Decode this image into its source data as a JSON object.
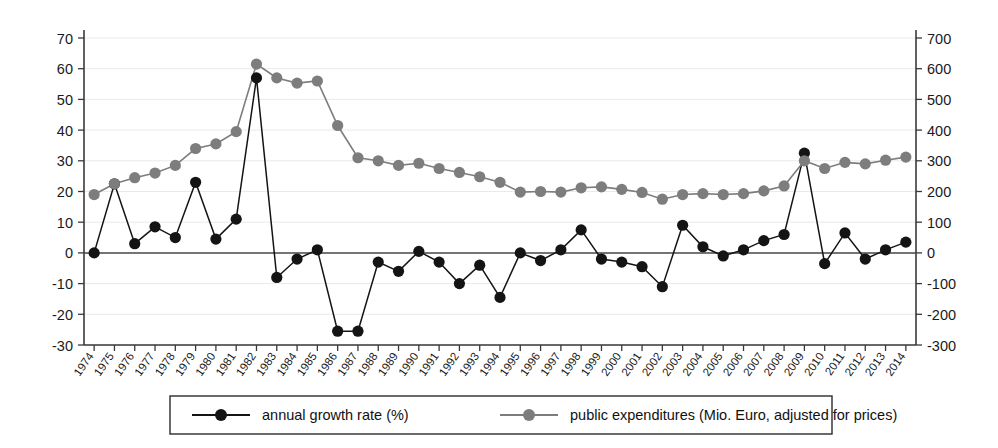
{
  "chart_data": {
    "type": "line",
    "title": "",
    "xlabel": "",
    "ylabel_left": "",
    "ylabel_right": "",
    "grid": true,
    "legend_position": "bottom",
    "categories": [
      "1974",
      "1975",
      "1976",
      "1977",
      "1978",
      "1979",
      "1980",
      "1981",
      "1982",
      "1983",
      "1984",
      "1985",
      "1986",
      "1987",
      "1988",
      "1989",
      "1990",
      "1991",
      "1992",
      "1993",
      "1994",
      "1995",
      "1996",
      "1997",
      "1998",
      "1999",
      "2000",
      "2001",
      "2002",
      "2003",
      "2004",
      "2005",
      "2006",
      "2007",
      "2008",
      "2009",
      "2010",
      "2011",
      "2012",
      "2013",
      "2014"
    ],
    "left_axis": {
      "label": "",
      "min": -30,
      "max": 70,
      "step": 10,
      "ticks": [
        "70",
        "60",
        "50",
        "40",
        "30",
        "20",
        "10",
        "0",
        "-10",
        "-20",
        "-30"
      ],
      "tick_values": [
        70,
        60,
        50,
        40,
        30,
        20,
        10,
        0,
        -10,
        -20,
        -30
      ]
    },
    "right_axis": {
      "label": "",
      "min": -300,
      "max": 700,
      "step": 100,
      "ticks": [
        "700",
        "600",
        "500",
        "400",
        "300",
        "200",
        "100",
        "0",
        "-100",
        "-200",
        "-300"
      ],
      "tick_values": [
        700,
        600,
        500,
        400,
        300,
        200,
        100,
        0,
        -100,
        -200,
        -300
      ]
    },
    "series": [
      {
        "name": "annual growth rate (%)",
        "axis": "left",
        "color": "#141414",
        "marker": "circle",
        "values": [
          0,
          22.5,
          3,
          8.5,
          5,
          23,
          4.5,
          11,
          57,
          -8,
          -2,
          1,
          -25.5,
          -25.5,
          -3,
          -6,
          0.5,
          -3,
          -10,
          -4,
          -14.5,
          0,
          -2.5,
          1,
          7.5,
          -2,
          -3,
          -4.5,
          -11,
          9,
          2,
          -1,
          1,
          4,
          6,
          32.5,
          -3.5,
          6.5,
          -2,
          1,
          3.5
        ]
      },
      {
        "name": "public expenditures (Mio. Euro, adjusted for prices)",
        "axis": "right",
        "color": "#7d7d7d",
        "marker": "circle",
        "values": [
          190,
          225,
          245,
          260,
          285,
          340,
          355,
          395,
          615,
          570,
          553,
          560,
          415,
          310,
          300,
          285,
          292,
          275,
          262,
          248,
          230,
          198,
          200,
          198,
          212,
          215,
          207,
          197,
          175,
          190,
          193,
          190,
          193,
          202,
          218,
          300,
          275,
          295,
          290,
          302,
          312
        ]
      }
    ],
    "legend": [
      {
        "label": "annual growth rate (%)",
        "color": "#141414",
        "marker": "circle"
      },
      {
        "label": "public expenditures (Mio. Euro, adjusted for prices)",
        "color": "#7d7d7d",
        "marker": "circle"
      }
    ]
  }
}
